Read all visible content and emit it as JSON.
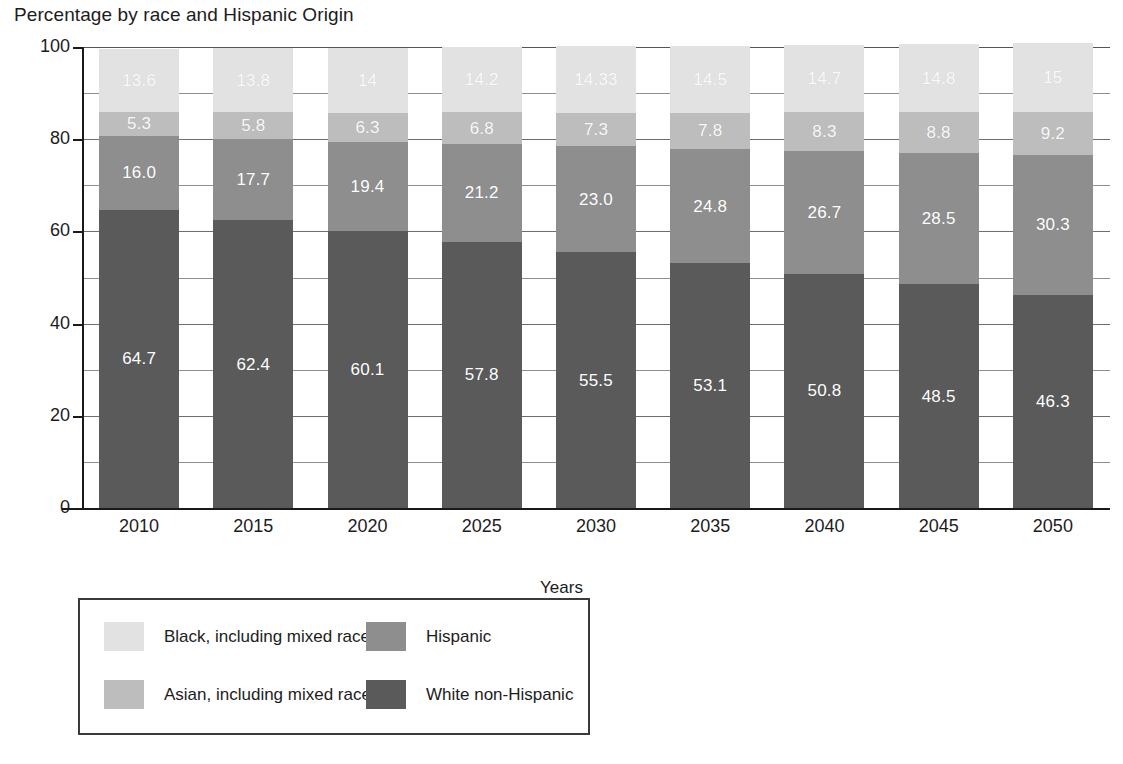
{
  "chart_data": {
    "type": "bar",
    "subtype": "stacked-bar-100",
    "title": "Percentage by race and Hispanic Origin",
    "xlabel": "Years",
    "ylabel": "",
    "ylim": [
      0,
      100
    ],
    "yticks": [
      0,
      20,
      40,
      60,
      80,
      100
    ],
    "ytick_labels": [
      "0",
      "20",
      "40",
      "60",
      "80",
      "100"
    ],
    "minor_gridlines": [
      10,
      30,
      50,
      70,
      90
    ],
    "grid": true,
    "legend_position": "bottom-left",
    "categories": [
      "2010",
      "2015",
      "2020",
      "2025",
      "2030",
      "2035",
      "2040",
      "2045",
      "2050"
    ],
    "series": [
      {
        "name": "White non-Hispanic",
        "color": "#5a5a5a",
        "values": [
          64.7,
          62.4,
          60.1,
          57.8,
          55.5,
          53.1,
          50.8,
          48.5,
          46.3
        ],
        "labels": [
          "64.7",
          "62.4",
          "60.1",
          "57.8",
          "55.5",
          "53.1",
          "50.8",
          "48.5",
          "46.3"
        ]
      },
      {
        "name": "Hispanic",
        "color": "#8e8e8e",
        "values": [
          16.0,
          17.7,
          19.4,
          21.2,
          23.0,
          24.8,
          26.7,
          28.5,
          30.3
        ],
        "labels": [
          "16.0",
          "17.7",
          "19.4",
          "21.2",
          "23.0",
          "24.8",
          "26.7",
          "28.5",
          "30.3"
        ]
      },
      {
        "name": "Asian, including mixed race",
        "color": "#bdbdbd",
        "values": [
          5.3,
          5.8,
          6.3,
          6.8,
          7.3,
          7.8,
          8.3,
          8.8,
          9.2
        ],
        "labels": [
          "5.3",
          "5.8",
          "6.3",
          "6.8",
          "7.3",
          "7.8",
          "8.3",
          "8.8",
          "9.2"
        ]
      },
      {
        "name": "Black, including mixed race",
        "color": "#e2e2e2",
        "values": [
          13.6,
          13.8,
          14.0,
          14.2,
          14.33,
          14.5,
          14.7,
          14.8,
          15.0
        ],
        "labels": [
          "13.6",
          "13.8",
          "14",
          "14.2",
          "14.33",
          "14.5",
          "14.7",
          "14.8",
          "15"
        ]
      }
    ]
  },
  "legend": {
    "items": [
      {
        "label": "Black, including mixed race",
        "color": "#e2e2e2"
      },
      {
        "label": "Hispanic",
        "color": "#8e8e8e"
      },
      {
        "label": "Asian, including mixed race",
        "color": "#bdbdbd"
      },
      {
        "label": "White non-Hispanic",
        "color": "#5a5a5a"
      }
    ]
  }
}
